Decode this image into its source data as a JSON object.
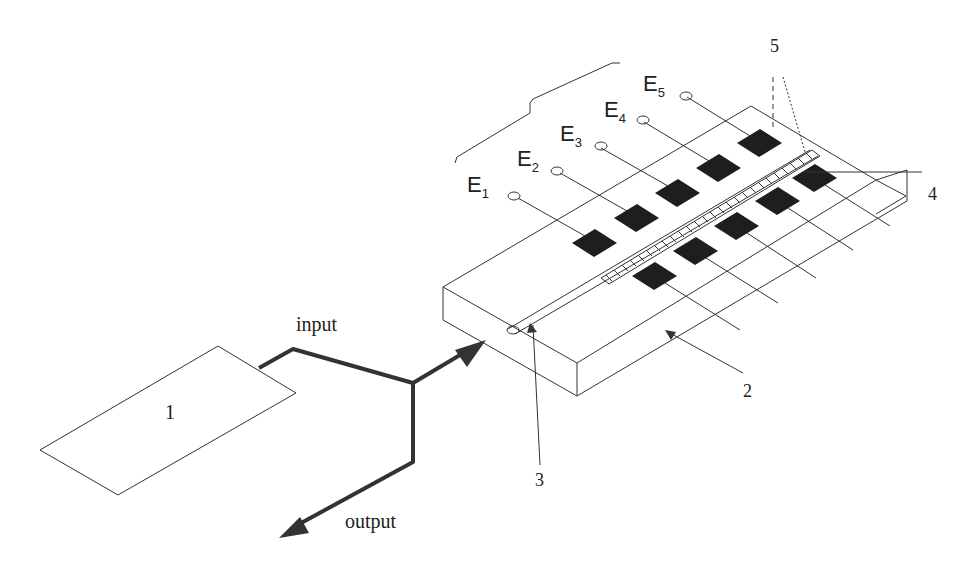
{
  "diagram": {
    "type": "schematic",
    "labels": {
      "device": "1",
      "substrate": "2",
      "waveguide": "3",
      "grating": "4",
      "electrodes_group": "5",
      "input": "input",
      "output": "output"
    },
    "electrodes": [
      {
        "letter": "E",
        "sub": "1"
      },
      {
        "letter": "E",
        "sub": "2"
      },
      {
        "letter": "E",
        "sub": "3"
      },
      {
        "letter": "E",
        "sub": "4"
      },
      {
        "letter": "E",
        "sub": "5"
      }
    ],
    "colors": {
      "line": "#333333",
      "pad": "#1e1e1e",
      "background": "#ffffff"
    }
  }
}
